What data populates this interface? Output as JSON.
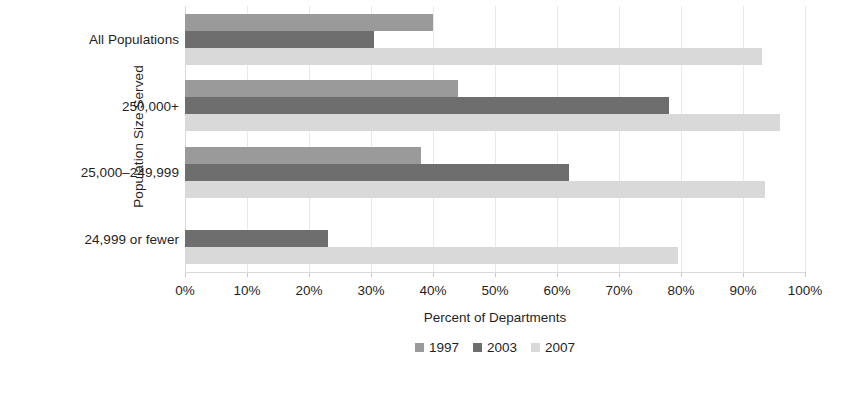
{
  "chart_data": {
    "type": "bar",
    "orientation": "horizontal",
    "title": "",
    "xlabel": "Percent of Departments",
    "ylabel": "Population Size Served",
    "xlim": [
      0,
      100
    ],
    "xticks": [
      "0%",
      "10%",
      "20%",
      "30%",
      "40%",
      "50%",
      "60%",
      "70%",
      "80%",
      "90%",
      "100%"
    ],
    "xtick_values": [
      0,
      10,
      20,
      30,
      40,
      50,
      60,
      70,
      80,
      90,
      100
    ],
    "grid": true,
    "legend_position": "bottom-center",
    "categories": [
      "All Populations",
      "250,000+",
      "25,000–249,999",
      "24,999 or fewer"
    ],
    "series": [
      {
        "name": "1997",
        "color": "#9a9a9a",
        "values": [
          40,
          44,
          38,
          0
        ]
      },
      {
        "name": "2003",
        "color": "#6e6e6e",
        "values": [
          30.5,
          78,
          62,
          23
        ]
      },
      {
        "name": "2007",
        "color": "#d9d9d9",
        "values": [
          93,
          96,
          93.5,
          79.5
        ]
      }
    ]
  },
  "legend": {
    "items": [
      {
        "label": "1997",
        "color": "#9a9a9a"
      },
      {
        "label": "2003",
        "color": "#6e6e6e"
      },
      {
        "label": "2007",
        "color": "#d9d9d9"
      }
    ]
  }
}
